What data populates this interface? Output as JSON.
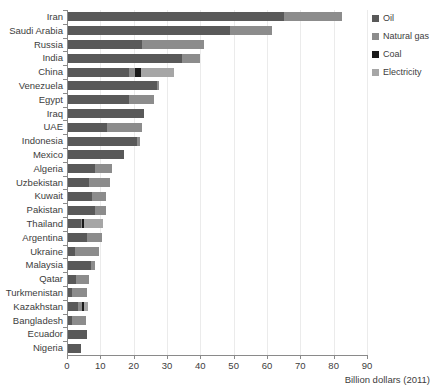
{
  "chart_data": {
    "type": "bar",
    "orientation": "horizontal",
    "stacked": true,
    "title": "",
    "xlabel": "Billion dollars (2011)",
    "ylabel": "",
    "xlim": [
      0,
      90
    ],
    "xticks": [
      0,
      10,
      20,
      30,
      40,
      50,
      60,
      70,
      80,
      90
    ],
    "grid": "vertical",
    "legend_position": "top-right",
    "categories": [
      "Iran",
      "Saudi Arabia",
      "Russia",
      "India",
      "China",
      "Venezuela",
      "Egypt",
      "Iraq",
      "UAE",
      "Indonesia",
      "Mexico",
      "Algeria",
      "Uzbekistan",
      "Kuwait",
      "Pakistan",
      "Thailand",
      "Argentina",
      "Ukraine",
      "Malaysia",
      "Qatar",
      "Turkmenistan",
      "Kazakhstan",
      "Bangladesh",
      "Ecuador",
      "Nigeria"
    ],
    "series": [
      {
        "name": "Oil",
        "color": "#595959",
        "values": [
          65.0,
          49.0,
          22.5,
          34.5,
          18.7,
          27.0,
          18.5,
          23.0,
          12.0,
          21.0,
          17.0,
          8.5,
          6.5,
          7.5,
          8.5,
          4.2,
          6.0,
          2.5,
          7.3,
          2.8,
          1.5,
          3.3,
          1.5,
          6.0,
          4.2
        ]
      },
      {
        "name": "Natural gas",
        "color": "#8c8c8c",
        "values": [
          17.5,
          12.6,
          18.5,
          5.5,
          1.8,
          0.5,
          7.5,
          0.0,
          10.6,
          1.0,
          0.0,
          5.0,
          6.5,
          4.2,
          3.2,
          0.3,
          4.5,
          7.1,
          1.1,
          3.8,
          4.5,
          1.3,
          4.3,
          0.0,
          0.0
        ]
      },
      {
        "name": "Coal",
        "color": "#1a1a1a",
        "values": [
          0.0,
          0.0,
          0.0,
          0.0,
          1.8,
          0.0,
          0.0,
          0.0,
          0.0,
          0.0,
          0.0,
          0.0,
          0.0,
          0.0,
          0.0,
          0.6,
          0.0,
          0.0,
          0.0,
          0.0,
          0.0,
          0.6,
          0.0,
          0.0,
          0.0
        ]
      },
      {
        "name": "Electricity",
        "color": "#a6a6a6",
        "values": [
          0.0,
          0.0,
          0.0,
          0.0,
          9.7,
          0.0,
          0.0,
          0.0,
          0.0,
          0.0,
          0.0,
          0.0,
          0.0,
          0.0,
          0.0,
          5.7,
          0.0,
          0.0,
          0.0,
          0.0,
          0.0,
          1.0,
          0.0,
          0.0,
          0.0
        ]
      }
    ],
    "totals": [
      82.5,
      61.6,
      41.0,
      40.0,
      32.0,
      27.5,
      26.0,
      23.0,
      22.6,
      22.0,
      17.0,
      13.5,
      13.0,
      11.7,
      11.7,
      10.8,
      10.5,
      9.6,
      8.4,
      6.6,
      6.0,
      6.2,
      5.8,
      6.0,
      4.2
    ]
  },
  "legend": {
    "items": [
      {
        "label": "Oil",
        "color": "#595959"
      },
      {
        "label": "Natural gas",
        "color": "#8c8c8c"
      },
      {
        "label": "Coal",
        "color": "#1a1a1a"
      },
      {
        "label": "Electricity",
        "color": "#a6a6a6"
      }
    ]
  }
}
